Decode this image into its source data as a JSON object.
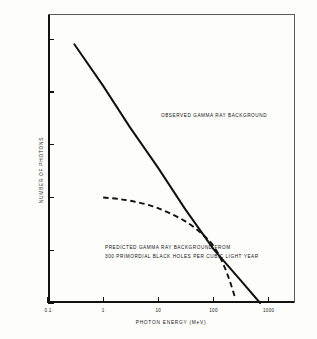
{
  "chart_data": {
    "type": "line",
    "title": "",
    "xlabel": "PHOTON ENERGY (MeV)",
    "ylabel": "NUMBER OF PHOTONS",
    "xscale": "log",
    "yscale": "log",
    "xlim": [
      0.1,
      3000
    ],
    "ylim": [
      0.01,
      3000
    ],
    "grid": false,
    "legend": "none (inline annotations)",
    "xticks": [
      "0.1",
      "1",
      "10",
      "100",
      "1000"
    ],
    "xtick_values": [
      0.1,
      1,
      10,
      100,
      1000
    ],
    "yticks": [
      "1000",
      "100",
      "10",
      "1",
      "0.1",
      "0.01"
    ],
    "ytick_values": [
      1000,
      100,
      10,
      1,
      0.1,
      0.01
    ],
    "series": [
      {
        "name": "OBSERVED GAMMA RAY BACKGROUND",
        "style": "solid",
        "color": "#111111",
        "x": [
          0.3,
          1,
          3,
          10,
          30,
          100,
          300,
          700
        ],
        "y": [
          800,
          130,
          22,
          3.6,
          0.62,
          0.105,
          0.028,
          0.01
        ]
      },
      {
        "name": "PREDICTED GAMMA RAY BACKGROUND FROM 300 PRIMORDIAL BLACK HOLES PER CUBIC LIGHT YEAR",
        "style": "dashed",
        "color": "#111111",
        "x": [
          1,
          2,
          4,
          8,
          15,
          30,
          60,
          100,
          150,
          200,
          250
        ],
        "y": [
          1.0,
          0.93,
          0.82,
          0.68,
          0.52,
          0.36,
          0.21,
          0.12,
          0.055,
          0.025,
          0.012
        ]
      }
    ],
    "annotations": [
      {
        "name": "observed-curve-label",
        "text": "OBSERVED GAMMA RAY BACKGROUND"
      },
      {
        "name": "predicted-curve-label-line1",
        "text": "PREDICTED GAMMA RAY BACKGROUND FROM"
      },
      {
        "name": "predicted-curve-label-line2",
        "text": "300 PRIMORDIAL BLACK HOLES PER CUBIC LIGHT YEAR"
      }
    ]
  },
  "axes": {
    "x_title": "PHOTON ENERGY (MeV)",
    "y_title": "NUMBER OF PHOTONS",
    "x_labels": [
      "0.1",
      "1",
      "10",
      "100",
      "1000"
    ],
    "y_labels": [
      "1000",
      "100",
      "10",
      "1",
      "0.1",
      "0.01"
    ]
  },
  "annotations": {
    "observed": "OBSERVED GAMMA RAY BACKGROUND",
    "predicted_line1": "PREDICTED GAMMA RAY BACKGROUND FROM",
    "predicted_line2": "300 PRIMORDIAL BLACK HOLES PER CUBIC LIGHT YEAR"
  },
  "colors": {
    "ink": "#111111",
    "paper": "#fdfdfc"
  }
}
